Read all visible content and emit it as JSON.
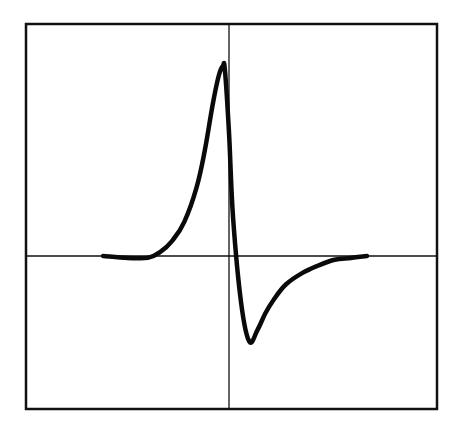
{
  "chart_data": {
    "type": "line",
    "title": "",
    "xlabel": "",
    "ylabel": "",
    "grid": false,
    "legend": null,
    "axes": {
      "crosshair": true,
      "x_axis_through_zero": true,
      "y_axis_through_zero": true
    },
    "xlim": [
      -1.0,
      1.0
    ],
    "ylim": [
      -1.0,
      1.0
    ],
    "series": [
      {
        "name": "waveform",
        "color": "#0a0a0a",
        "x": [
          -0.62,
          -0.5,
          -0.4,
          -0.34,
          -0.28,
          -0.22,
          -0.16,
          -0.12,
          -0.08,
          -0.05,
          -0.03,
          -0.02,
          0.0,
          0.02,
          0.06,
          0.1,
          0.14,
          0.18,
          0.22,
          0.28,
          0.36,
          0.44,
          0.52,
          0.6,
          0.68
        ],
        "y": [
          0.0,
          -0.01,
          -0.01,
          0.02,
          0.08,
          0.18,
          0.36,
          0.55,
          0.8,
          0.95,
          1.0,
          0.98,
          0.65,
          0.2,
          -0.25,
          -0.45,
          -0.39,
          -0.3,
          -0.23,
          -0.15,
          -0.09,
          -0.05,
          -0.02,
          -0.01,
          0.0
        ]
      }
    ]
  },
  "colors": {
    "background": "#ffffff",
    "ink": "#0a0a0a"
  }
}
